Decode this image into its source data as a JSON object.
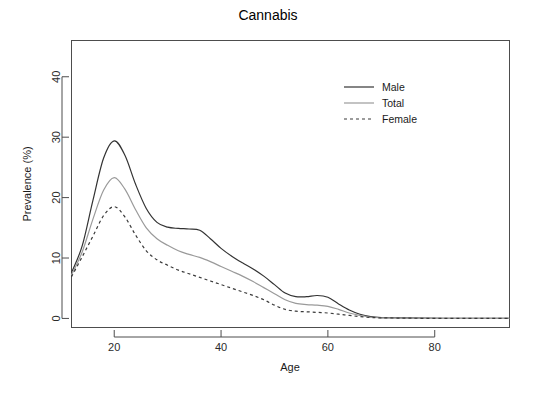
{
  "chart_data": {
    "type": "line",
    "title": "Cannabis",
    "subtitle": "",
    "xlabel": "Age",
    "ylabel": "Prevalence (%)",
    "xlim": [
      12,
      94
    ],
    "ylim": [
      -1.5,
      46
    ],
    "xticks": [
      20,
      40,
      60,
      80
    ],
    "yticks": [
      0,
      10,
      20,
      30,
      40
    ],
    "grid": false,
    "legend_position": "top-right",
    "x": [
      12,
      14,
      16,
      18,
      20,
      22,
      24,
      26,
      28,
      30,
      32,
      34,
      36,
      38,
      40,
      42,
      44,
      46,
      48,
      50,
      52,
      54,
      56,
      58,
      60,
      62,
      64,
      66,
      68,
      70,
      74,
      78,
      82,
      86,
      90,
      94
    ],
    "series": [
      {
        "name": "Male",
        "color": "#333333",
        "dash": "none",
        "width": 1.2,
        "values": [
          7.6,
          12.0,
          19.5,
          26.5,
          29.4,
          27.0,
          22.2,
          18.2,
          15.9,
          15.1,
          14.9,
          14.8,
          14.6,
          13.2,
          11.6,
          10.3,
          9.2,
          8.2,
          7.0,
          5.6,
          4.2,
          3.6,
          3.6,
          3.8,
          3.5,
          2.4,
          1.4,
          0.7,
          0.3,
          0.15,
          0.1,
          0.05,
          0.02,
          0.0,
          0.0,
          0.0
        ]
      },
      {
        "name": "Total",
        "color": "#9a9a9a",
        "dash": "none",
        "width": 1.2,
        "values": [
          7.2,
          11.0,
          16.4,
          21.2,
          23.3,
          21.4,
          18.0,
          15.0,
          13.2,
          12.1,
          11.2,
          10.6,
          10.1,
          9.4,
          8.6,
          7.8,
          7.0,
          6.1,
          5.1,
          4.1,
          3.1,
          2.5,
          2.3,
          2.2,
          2.0,
          1.5,
          0.9,
          0.5,
          0.2,
          0.1,
          0.05,
          0.02,
          0.0,
          0.0,
          0.0,
          0.0
        ]
      },
      {
        "name": "Female",
        "color": "#3a3a3a",
        "dash": "3,3",
        "width": 1.2,
        "values": [
          6.9,
          10.2,
          13.6,
          17.0,
          18.5,
          16.8,
          13.8,
          11.2,
          9.7,
          8.8,
          8.0,
          7.4,
          6.8,
          6.2,
          5.6,
          5.0,
          4.4,
          3.8,
          3.1,
          2.2,
          1.5,
          1.2,
          1.1,
          1.0,
          0.9,
          0.7,
          0.5,
          0.3,
          0.15,
          0.1,
          0.05,
          0.02,
          0.0,
          0.0,
          0.0,
          0.0
        ]
      }
    ],
    "legend_entries": [
      {
        "label": "Male",
        "color": "#333333",
        "dash": "none"
      },
      {
        "label": "Total",
        "color": "#9a9a9a",
        "dash": "none"
      },
      {
        "label": "Female",
        "color": "#3a3a3a",
        "dash": "3,3"
      }
    ]
  }
}
